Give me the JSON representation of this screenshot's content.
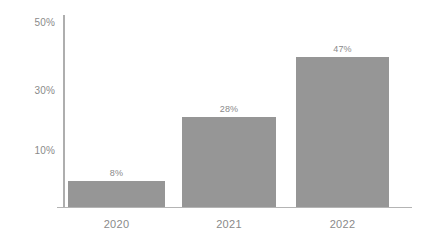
{
  "chart_data": {
    "type": "bar",
    "title": "",
    "subtitle": "",
    "xlabel": "",
    "ylabel": "",
    "categories": [
      "2020",
      "2021",
      "2022"
    ],
    "values": [
      8,
      28,
      47
    ],
    "value_labels": [
      "8%",
      "28%",
      "47%"
    ],
    "ytick_labels": [
      "50%",
      "30%",
      "10%"
    ],
    "ytick_values": [
      50,
      30,
      10
    ],
    "ylim": [
      0,
      55
    ],
    "grid": false,
    "legend": null,
    "legend_position": "none",
    "unit": "%",
    "colors": {
      "bar": "#969696",
      "axis": "#b0b0b0",
      "text": "#8a8a8a",
      "background": "#ffffff"
    }
  }
}
